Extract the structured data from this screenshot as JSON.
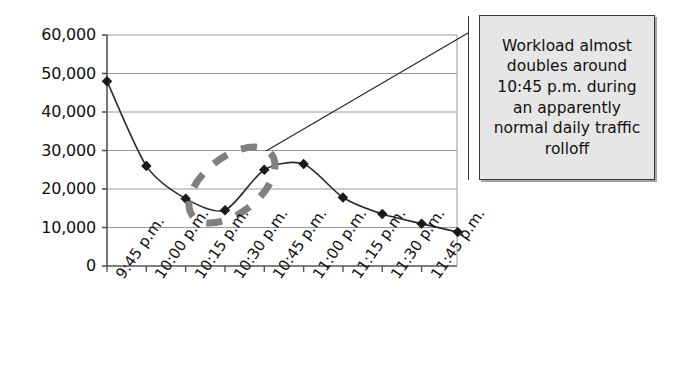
{
  "figure": {
    "background_color": "#ffffff",
    "line_color": "#2b2b2b",
    "marker_color": "#1a1a1a",
    "grid_color": "#9a9a9a",
    "axis_color": "#555555",
    "highlight_color": "#808080",
    "callout_fill": "#e6e6e6",
    "callout_border": "#3a3a3a"
  },
  "callout": {
    "text": "Workload almost doubles around 10:45 p.m. during an apparently normal daily traffic rolloff",
    "leader_label": "callout-leader-line"
  },
  "highlight": {
    "label": "dashed-ellipse-highlight",
    "style": "dashed oval"
  },
  "chart_data": {
    "type": "line",
    "title": "",
    "xlabel": "",
    "ylabel": "",
    "categories": [
      "9:45 p.m.",
      "10:00 p.m.",
      "10:15 p.m.",
      "10:30 p.m.",
      "10:45 p.m.",
      "11:00 p.m.",
      "11:15 p.m.",
      "11:30 p.m.",
      "11:45 p.m."
    ],
    "values": [
      48000,
      26000,
      17500,
      14500,
      25000,
      26500,
      17800,
      13500,
      11000
    ],
    "extra_point": {
      "x_fraction": 1.115,
      "value": 8800
    },
    "yticks": [
      0,
      10000,
      20000,
      30000,
      40000,
      50000,
      60000
    ],
    "ytick_labels": [
      "0",
      "10,000",
      "20,000",
      "30,000",
      "40,000",
      "50,000",
      "60,000"
    ],
    "ylim": [
      0,
      60000
    ],
    "grid": true,
    "legend": false,
    "markers": "diamond",
    "smoothing": true
  }
}
